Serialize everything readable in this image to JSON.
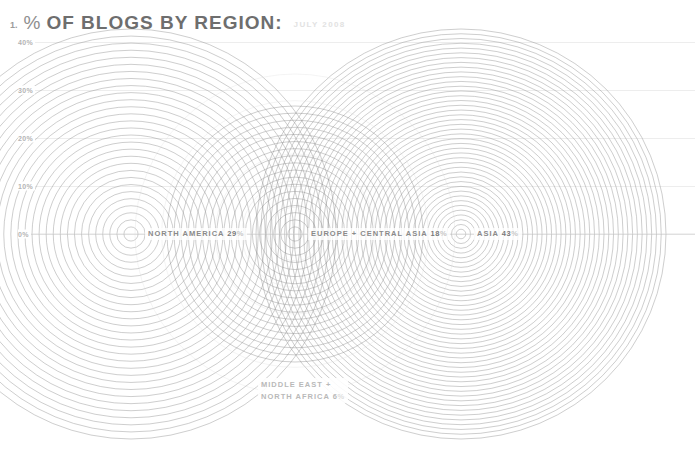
{
  "header": {
    "figure_number": "1.",
    "percent_symbol": "%",
    "title": "OF BLOGS BY REGION:",
    "subtitle": "JULY 2008"
  },
  "axis": {
    "ticks": [
      {
        "label": "40%",
        "value": 40
      },
      {
        "label": "30%",
        "value": 30
      },
      {
        "label": "20%",
        "value": 20
      },
      {
        "label": "10%",
        "value": 10
      },
      {
        "label": "0%",
        "value": 0
      }
    ],
    "ymin": 0,
    "ymax": 40
  },
  "labels": {
    "north_america": {
      "name": "NORTH AMERICA",
      "value": "29",
      "unit": "%"
    },
    "europe_central_asia": {
      "name": "EUROPE + CENTRAL ASIA",
      "value": "18",
      "unit": "%"
    },
    "asia": {
      "name": "ASIA",
      "value": "43",
      "unit": "%"
    },
    "middle_east_line1": {
      "name": "MIDDLE EAST +"
    },
    "middle_east_line2": {
      "name": "NORTH AFRICA",
      "value": "6",
      "unit": "%"
    }
  },
  "colors": {
    "title": "#6e6e6e",
    "subtitle": "#e2e2e2",
    "grid": "#ededed",
    "ring": "#8c8c8c",
    "ring_faint": "#d8d8d8",
    "tick": "#b4b4b4",
    "background": "#ffffff"
  },
  "chart_data": {
    "type": "area",
    "title": "% OF BLOGS BY REGION:",
    "subtitle": "JULY 2008",
    "xlabel": "",
    "ylabel": "%",
    "ylim": [
      0,
      40
    ],
    "grid": true,
    "legend": "inline-labels",
    "note": "Concentric-ring bubbles; ring radius encodes percent on the same scale as the y axis. Baseline (0%) is the horizontal centerline through all bubble centers.",
    "categories": [
      "NORTH AMERICA",
      "EUROPE + CENTRAL ASIA",
      "ASIA",
      "MIDDLE EAST + NORTH AFRICA"
    ],
    "values": [
      29,
      18,
      43,
      6
    ],
    "units": "%",
    "series": [
      {
        "name": "% of blogs",
        "values": [
          29,
          18,
          43,
          6
        ]
      }
    ],
    "bubbles": [
      {
        "label": "NORTH AMERICA",
        "value": 29,
        "cx": 131,
        "cy": 234,
        "radius_px": 205,
        "ring_count": 29,
        "faint": false
      },
      {
        "label": "EUROPE + CENTRAL ASIA",
        "value": 18,
        "cx": 295,
        "cy": 234,
        "radius_px": 128,
        "ring_count": 18,
        "faint": false
      },
      {
        "label": "ASIA",
        "value": 43,
        "cx": 461,
        "cy": 234,
        "radius_px": 205,
        "ring_count": 43,
        "faint": false
      },
      {
        "label": "MIDDLE EAST + NORTH AFRICA",
        "value": 6,
        "cx": 295,
        "cy": 234,
        "radius_px": 160,
        "ring_count": 6,
        "faint": true
      }
    ]
  }
}
